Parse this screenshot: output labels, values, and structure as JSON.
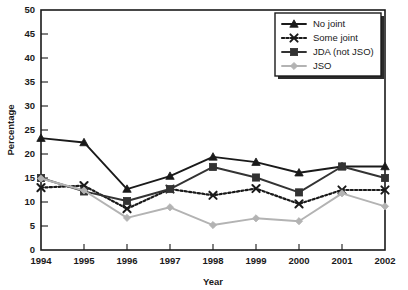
{
  "chart_data": {
    "type": "line",
    "title": "",
    "xlabel": "Year",
    "ylabel": "Percentage",
    "categories": [
      1994,
      1995,
      1996,
      1997,
      1998,
      1999,
      2000,
      2001,
      2002
    ],
    "x": [
      "1994",
      "1995",
      "1996",
      "1997",
      "1998",
      "1999",
      "2000",
      "2001",
      "2002"
    ],
    "xlim": [
      1994,
      2002
    ],
    "ylim": [
      0,
      50
    ],
    "ytick_labels": [
      "0",
      "5",
      "10",
      "15",
      "20",
      "25",
      "30",
      "35",
      "40",
      "45",
      "50"
    ],
    "ytick_values": [
      0,
      5,
      10,
      15,
      20,
      25,
      30,
      35,
      40,
      45,
      50
    ],
    "ytick_step": 5,
    "grid": false,
    "legend_position": "top-right",
    "series": [
      {
        "name": "No joint",
        "values": [
          23.3,
          22.4,
          12.7,
          15.4,
          19.4,
          18.3,
          16.1,
          17.4,
          17.4
        ],
        "color": "#1a1a1a",
        "marker": "triangle",
        "dash": "solid"
      },
      {
        "name": "Some joint",
        "values": [
          13.0,
          13.4,
          8.6,
          12.7,
          11.4,
          12.8,
          9.6,
          12.5,
          12.5
        ],
        "color": "#1a1a1a",
        "marker": "x",
        "dash": "dotted"
      },
      {
        "name": "JDA (not JSO)",
        "values": [
          15.0,
          12.2,
          10.2,
          12.7,
          17.3,
          15.1,
          12.0,
          17.4,
          15.0
        ],
        "color": "#333333",
        "marker": "square",
        "dash": "solid"
      },
      {
        "name": "JSO",
        "values": [
          14.9,
          12.4,
          6.7,
          8.9,
          5.2,
          6.6,
          6.0,
          11.8,
          9.1
        ],
        "color": "#b3b3b3",
        "marker": "diamond",
        "dash": "solid"
      }
    ]
  },
  "legend": {
    "items": [
      {
        "label": "No joint"
      },
      {
        "label": "Some joint"
      },
      {
        "label": "JDA (not JSO)"
      },
      {
        "label": "JSO"
      }
    ]
  },
  "axes": {
    "y_title": "Percentage",
    "x_title": "Year"
  }
}
